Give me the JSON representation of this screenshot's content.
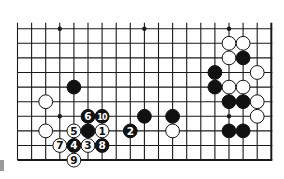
{
  "diagram": {
    "type": "go-board-fragment",
    "grid": {
      "cols": 19,
      "rows": 10,
      "origin_x": 17.5,
      "origin_y": 28.7,
      "step_x": 14.1,
      "step_y": 14.6,
      "open_top": true,
      "open_left": true,
      "edge_right": true,
      "edge_bottom": true
    },
    "colors": {
      "line": "#1a1a1a",
      "black_stone": "#111111",
      "white_stone": "#ffffff",
      "background": "#ffffff"
    },
    "star_points": [
      {
        "col": 3,
        "row": 0
      },
      {
        "col": 9,
        "row": 0
      },
      {
        "col": 15,
        "row": 0
      },
      {
        "col": 3,
        "row": 6
      },
      {
        "col": 15,
        "row": 6
      }
    ],
    "stones": [
      {
        "color": "white",
        "col": 15,
        "row": 1,
        "label": ""
      },
      {
        "color": "white",
        "col": 16,
        "row": 1,
        "label": ""
      },
      {
        "color": "white",
        "col": 15,
        "row": 2,
        "label": ""
      },
      {
        "color": "black",
        "col": 16,
        "row": 2,
        "label": ""
      },
      {
        "color": "black",
        "col": 14,
        "row": 3,
        "label": ""
      },
      {
        "color": "white",
        "col": 17,
        "row": 3,
        "label": ""
      },
      {
        "color": "black",
        "col": 14,
        "row": 4,
        "label": ""
      },
      {
        "color": "white",
        "col": 15,
        "row": 4,
        "label": ""
      },
      {
        "color": "white",
        "col": 16,
        "row": 4,
        "label": ""
      },
      {
        "color": "black",
        "col": 15,
        "row": 5,
        "label": ""
      },
      {
        "color": "black",
        "col": 16,
        "row": 5,
        "label": ""
      },
      {
        "color": "white",
        "col": 17,
        "row": 5,
        "label": ""
      },
      {
        "color": "white",
        "col": 17,
        "row": 6,
        "label": ""
      },
      {
        "color": "black",
        "col": 15,
        "row": 7,
        "label": ""
      },
      {
        "color": "black",
        "col": 16,
        "row": 7,
        "label": ""
      },
      {
        "color": "black",
        "col": 4,
        "row": 4,
        "label": ""
      },
      {
        "color": "white",
        "col": 2,
        "row": 5,
        "label": ""
      },
      {
        "color": "white",
        "col": 2,
        "row": 7,
        "label": ""
      },
      {
        "color": "black",
        "col": 9,
        "row": 6,
        "label": ""
      },
      {
        "color": "black",
        "col": 11,
        "row": 6,
        "label": ""
      },
      {
        "color": "white",
        "col": 11,
        "row": 7,
        "label": ""
      },
      {
        "color": "black",
        "col": 5,
        "row": 7,
        "label": ""
      },
      {
        "color": "white",
        "col": 6,
        "row": 7,
        "label": "1"
      },
      {
        "color": "black",
        "col": 8,
        "row": 7,
        "label": "2"
      },
      {
        "color": "white",
        "col": 5,
        "row": 8,
        "label": "3"
      },
      {
        "color": "black",
        "col": 4,
        "row": 8,
        "label": "4"
      },
      {
        "color": "white",
        "col": 4,
        "row": 7,
        "label": "5"
      },
      {
        "color": "black",
        "col": 5,
        "row": 6,
        "label": "6"
      },
      {
        "color": "white",
        "col": 3,
        "row": 8,
        "label": "7"
      },
      {
        "color": "black",
        "col": 6,
        "row": 8,
        "label": "8"
      },
      {
        "color": "white",
        "col": 4,
        "row": 9,
        "label": "9"
      },
      {
        "color": "black",
        "col": 6,
        "row": 6,
        "label": "10"
      }
    ]
  }
}
